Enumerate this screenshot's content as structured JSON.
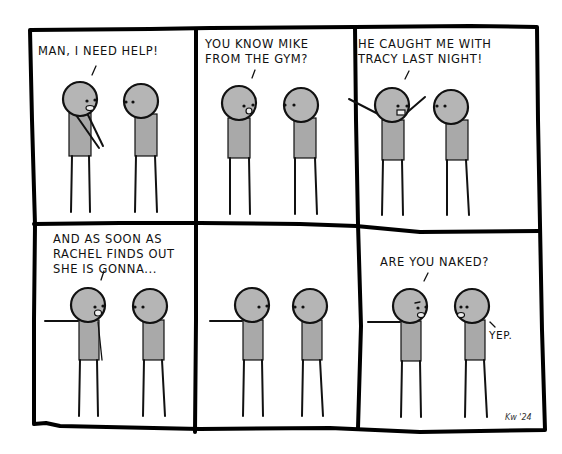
{
  "comic": {
    "layout": {
      "rows": 2,
      "columns": 3
    },
    "panels": [
      {
        "index": 1,
        "speaker": "left",
        "text": "MAN, I NEED HELP!",
        "left_pose": "hand-forward",
        "left_mouth": "open"
      },
      {
        "index": 2,
        "speaker": "left",
        "text": "YOU KNOW MIKE\nFROM THE GYM?",
        "left_pose": "arms-down",
        "left_mouth": "open"
      },
      {
        "index": 3,
        "speaker": "left",
        "text": "HE CAUGHT ME WITH\nTRACY LAST NIGHT!",
        "left_pose": "arms-raised",
        "left_mouth": "open"
      },
      {
        "index": 4,
        "speaker": "left",
        "text": "AND AS SOON AS\nRACHEL FINDS OUT\nSHE IS GONNA...",
        "left_pose": "arm-out-left",
        "left_mouth": "open"
      },
      {
        "index": 5,
        "speaker": "none",
        "text": "",
        "left_pose": "arm-out-left",
        "left_mouth": "closed"
      },
      {
        "index": 6,
        "speaker": "both",
        "text": "ARE YOU NAKED?",
        "reply": "YEP.",
        "left_pose": "arm-out-left",
        "left_mouth": "open"
      }
    ],
    "signature": "Kw '24",
    "colors": {
      "ink": "#111111",
      "skin": "#b5b5b5",
      "shirt": "#a9a9a9",
      "background": "#ffffff"
    }
  }
}
